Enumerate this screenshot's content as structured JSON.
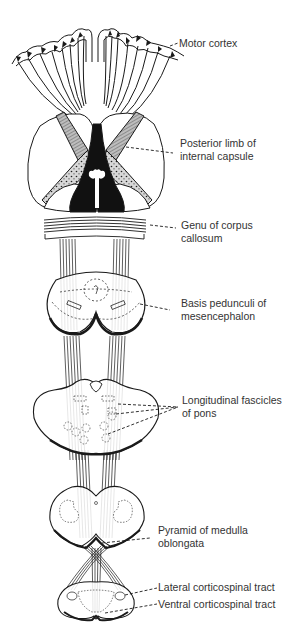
{
  "figure": {
    "type": "anatomical-diagram",
    "line_color": "#1a1a1a",
    "text_color": "#333333",
    "background": "#ffffff"
  },
  "labels": [
    {
      "id": "motor-cortex",
      "lines": [
        "Motor cortex"
      ]
    },
    {
      "id": "posterior-limb",
      "lines": [
        "Posterior limb of",
        "internal capsule"
      ]
    },
    {
      "id": "genu",
      "lines": [
        "Genu of corpus",
        "callosum"
      ]
    },
    {
      "id": "basis-pedunculi",
      "lines": [
        "Basis pedunculi of",
        "mesencephalon"
      ]
    },
    {
      "id": "longitudinal-fascicles",
      "lines": [
        "Longitudinal fascicles",
        "of pons"
      ]
    },
    {
      "id": "pyramid",
      "lines": [
        "Pyramid of medulla",
        "oblongata"
      ]
    },
    {
      "id": "lateral-tract",
      "lines": [
        "Lateral corticospinal tract"
      ]
    },
    {
      "id": "ventral-tract",
      "lines": [
        "Ventral corticospinal tract"
      ]
    }
  ]
}
